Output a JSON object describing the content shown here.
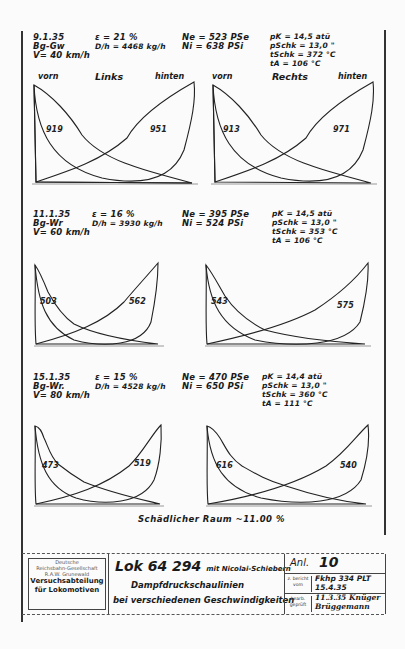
{
  "document": {
    "type": "Indicator diagram sheet (steam locomotive test)",
    "dead_space_note": "Schädlicher Raum ~11.00 %",
    "column_headers": {
      "left_side": "Links",
      "right_side": "Rechts",
      "front": "vorn",
      "rear": "hinten"
    },
    "tests": [
      {
        "date": "9.1.35",
        "train": "Bg-Gw",
        "speed": "V= 40 km/h",
        "cutoff": "ε = 21 %",
        "steam": "D/h = 4468 kg/h",
        "ne": "Ne = 523 PSe",
        "ni": "Ni = 638 PSi",
        "pk": "pK = 14,5 atü",
        "p_schieber": "pSchk = 13,0 \"",
        "t_schieber": "tSchk = 372 °C",
        "t_abdampf": "tA = 106 °C",
        "areas": {
          "left_front": "919",
          "left_rear": "951",
          "right_front": "913",
          "right_rear": "971"
        }
      },
      {
        "date": "11.1.35",
        "train": "Bg-Wr",
        "speed": "V= 60 km/h",
        "cutoff": "ε = 16 %",
        "steam": "D/h = 3930 kg/h",
        "ne": "Ne = 395 PSe",
        "ni": "Ni = 524 PSi",
        "pk": "pK = 14,5 atü",
        "p_schieber": "pSchk = 13,0 \"",
        "t_schieber": "tSchk = 353 °C",
        "t_abdampf": "tA = 106 °C",
        "areas": {
          "left_front": "503",
          "left_rear": "562",
          "right_front": "543",
          "right_rear": "575"
        }
      },
      {
        "date": "15.1.35",
        "train": "Bg-Wr.",
        "speed": "V= 80 km/h",
        "cutoff": "ε = 15 %",
        "steam": "D/h = 4528 kg/h",
        "ne": "Ne = 470 PSe",
        "ni": "Ni = 650 PSi",
        "pk": "pK = 14,4 atü",
        "p_schieber": "pSchk = 13,0 \"",
        "t_schieber": "tSchk = 360 °C",
        "t_abdampf": "tA = 111 °C",
        "areas": {
          "left_front": "473",
          "left_rear": "519",
          "right_front": "616",
          "right_rear": "540"
        }
      }
    ],
    "title_block": {
      "org_line1": "Deutsche",
      "org_line2": "Reichsbahn-Gesellschaft",
      "org_line3": "R.A.W. Grunewald",
      "dept_line1": "Versuchsabteilung",
      "dept_line2": "für Lokomotiven",
      "loco": "Lok 64 294",
      "loco_suffix": "mit Nicolai-Schiebern",
      "subject_line1": "Dampfdruckschaulinien",
      "subject_line2": "bei verschiedenen Geschwindigkeiten",
      "anl_label": "Anl.",
      "anl_value": "10",
      "drawn_label": "z. bericht vom",
      "drawn_value_1": "Fkhp 334 PLT",
      "drawn_value_2": "15.4.35",
      "checked_label": "bearb. geprüft",
      "checked_value_1": "11.3.35 Knüger",
      "checked_value_2": "Brüggemann"
    }
  }
}
